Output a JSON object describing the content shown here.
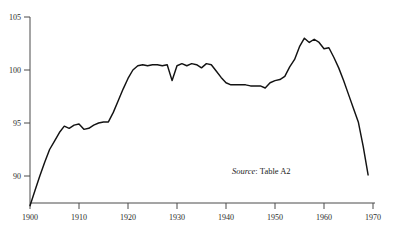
{
  "figure": {
    "title": "",
    "background_color": "#ffffff",
    "line_color": "#131313",
    "axis_color": "#4a4a4a"
  },
  "source_note": {
    "label": "Source",
    "separator": ":",
    "value": "Table A2",
    "full_text": "Source: Table A2"
  },
  "chart_data": {
    "type": "line",
    "title": "",
    "xlabel": "",
    "ylabel": "",
    "xlim": [
      1900,
      1970
    ],
    "ylim": [
      86.5,
      105.6
    ],
    "grid": false,
    "legend": false,
    "xticks": [
      1900,
      1910,
      1920,
      1930,
      1940,
      1950,
      1960,
      1970
    ],
    "xtick_labels": [
      "1900",
      "1910",
      "1920",
      "1930",
      "1940",
      "1950",
      "1960",
      "1970"
    ],
    "yticks": [
      90,
      95,
      100,
      105
    ],
    "ytick_labels": [
      "90",
      "95",
      "100",
      "105"
    ],
    "series": [
      {
        "name": "index",
        "x": [
          1900,
          1901,
          1902,
          1903,
          1904,
          1905,
          1906,
          1907,
          1908,
          1909,
          1910,
          1911,
          1912,
          1913,
          1914,
          1915,
          1916,
          1917,
          1918,
          1919,
          1920,
          1921,
          1922,
          1923,
          1924,
          1925,
          1926,
          1927,
          1928,
          1929,
          1930,
          1931,
          1932,
          1933,
          1934,
          1935,
          1936,
          1937,
          1938,
          1939,
          1940,
          1941,
          1942,
          1943,
          1944,
          1945,
          1946,
          1947,
          1948,
          1949,
          1950,
          1951,
          1952,
          1953,
          1954,
          1955,
          1956,
          1957,
          1958,
          1959,
          1960,
          1961,
          1962,
          1963,
          1964,
          1965,
          1966,
          1967,
          1968,
          1969
        ],
        "y": [
          87.2,
          88.6,
          90.0,
          91.3,
          92.5,
          93.3,
          94.1,
          94.7,
          94.5,
          94.8,
          94.9,
          94.4,
          94.5,
          94.8,
          95.0,
          95.1,
          95.1,
          96.0,
          97.1,
          98.2,
          99.2,
          100.0,
          100.4,
          100.5,
          100.4,
          100.5,
          100.5,
          100.4,
          100.5,
          99.0,
          100.4,
          100.6,
          100.4,
          100.6,
          100.5,
          100.2,
          100.6,
          100.5,
          99.9,
          99.3,
          98.8,
          98.6,
          98.6,
          98.6,
          98.6,
          98.5,
          98.5,
          98.5,
          98.3,
          98.8,
          99.0,
          99.1,
          99.4,
          100.3,
          101.0,
          102.2,
          103.0,
          102.6,
          102.9,
          102.6,
          102.0,
          102.1,
          101.2,
          100.2,
          99.0,
          97.7,
          96.4,
          95.1,
          92.8,
          90.1
        ]
      }
    ]
  },
  "plot_geometry": {
    "x_px_min": 30,
    "x_px_max": 373,
    "y_px_for_105": 17,
    "y_px_for_90": 176
  }
}
